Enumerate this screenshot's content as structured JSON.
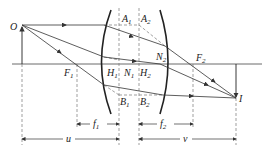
{
  "diagram": {
    "type": "thick-lens ray diagram",
    "labels": {
      "object": "O",
      "image": "I",
      "focus1": "F",
      "focus1_sub": "1",
      "focus2": "F",
      "focus2_sub": "2",
      "principal1": "H",
      "principal1_sub": "1",
      "principal2": "H",
      "principal2_sub": "2",
      "nodal1": "N",
      "nodal1_sub": "1",
      "nodal2": "N",
      "nodal2_sub": "2",
      "a1": "A",
      "a1_sub": "1",
      "a2": "A",
      "a2_sub": "2",
      "b1": "B",
      "b1_sub": "1",
      "b2": "B",
      "b2_sub": "2"
    },
    "dimensions": {
      "f1": "f",
      "f1_sub": "1",
      "f2": "f",
      "f2_sub": "2",
      "u": "u",
      "v": "v"
    },
    "colors": {
      "line": "#333333",
      "dashed": "#666666"
    }
  }
}
